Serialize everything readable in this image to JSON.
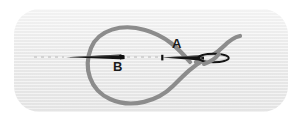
{
  "figure": {
    "panel": {
      "name": "illustration-panel",
      "background_color": "#ebebeb",
      "corner_radius_px": 26,
      "x": 14,
      "y": 9,
      "width": 274,
      "height": 103
    },
    "labels": [
      {
        "id": "A",
        "text": "A",
        "x": 172,
        "y": 37,
        "color": "#1a1a1a",
        "describes": "right needle with thread through eye"
      },
      {
        "id": "B",
        "text": "B",
        "x": 113,
        "y": 60,
        "color": "#1a1a1a",
        "describes": "left needle tip"
      }
    ],
    "elements": {
      "thread": {
        "name": "thread-loop",
        "color": "#8c8c8c",
        "stroke_width_px": 4.2,
        "shape": "large open loop crossing near the right needle shaft, tail curving up to the right"
      },
      "needle_left": {
        "name": "needle-left",
        "color": "#141414",
        "tip_x": 66,
        "eye_x": 124,
        "y": 57,
        "orientation": "tip pointing left"
      },
      "needle_right": {
        "name": "needle-right",
        "color": "#141414",
        "tip_x": 162,
        "eye_center_x": 214,
        "y": 58,
        "orientation": "tip pointing left, eye at right end"
      },
      "guide_line": {
        "name": "dashed-guide-line",
        "color": "#c9c9c9",
        "dash": "3 4",
        "y": 57,
        "segments": [
          [
            34,
            64
          ],
          [
            126,
            161
          ]
        ]
      }
    }
  }
}
